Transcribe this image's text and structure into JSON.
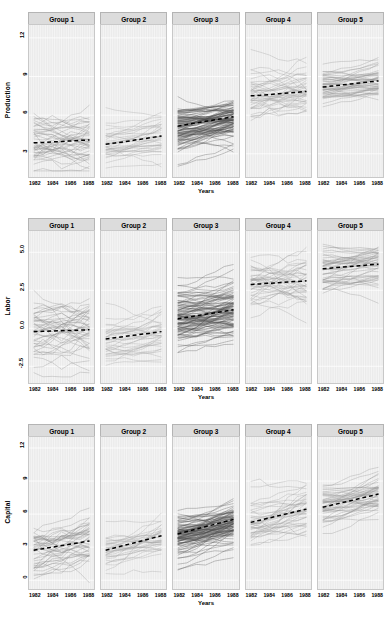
{
  "chart_data": {
    "type": "line",
    "title": "",
    "xlabel": "Years",
    "layout": "trellis 3 rows x 5 columns, spaghetti plot with dashed group-mean trend",
    "grid": true,
    "legend": "none",
    "x": [
      1982,
      1983,
      1984,
      1985,
      1986,
      1987,
      1988
    ],
    "xticks": [
      "1982",
      "1984",
      "1986",
      "1988"
    ],
    "xlim": [
      1981.5,
      1988.5
    ],
    "columns": [
      "Group 1",
      "Group 2",
      "Group 3",
      "Group 4",
      "Group 5"
    ],
    "rows": [
      {
        "ylabel": "Production",
        "ylim": [
          1.2,
          13.0
        ],
        "yticks": [
          "3",
          "6",
          "9",
          "12"
        ],
        "ytick_values": [
          3,
          6,
          9,
          12
        ],
        "panels": [
          {
            "group": "Group 1",
            "n_lines": 44,
            "band_low": 2.2,
            "band_high": 6.6,
            "trend": [
              3.85,
              3.88,
              3.92,
              3.96,
              4.0,
              4.04,
              4.08
            ],
            "spread": 0.95,
            "noise": 0.42,
            "slope_spread": 0.22,
            "line_color": "#8c8c8c",
            "seed": 11
          },
          {
            "group": "Group 2",
            "n_lines": 34,
            "band_low": 2.4,
            "band_high": 6.9,
            "trend": [
              3.74,
              3.84,
              3.94,
              4.05,
              4.16,
              4.27,
              4.38
            ],
            "spread": 0.85,
            "noise": 0.16,
            "slope_spread": 0.14,
            "line_color": "#a0a0a0",
            "seed": 23
          },
          {
            "group": "Group 3",
            "n_lines": 96,
            "band_low": 2.6,
            "band_high": 7.2,
            "trend": [
              5.15,
              5.28,
              5.4,
              5.52,
              5.64,
              5.76,
              5.88
            ],
            "spread": 0.78,
            "noise": 0.14,
            "slope_spread": 0.13,
            "line_color": "#4a4a4a",
            "seed": 37
          },
          {
            "group": "Group 4",
            "n_lines": 40,
            "band_low": 4.6,
            "band_high": 9.6,
            "trend": [
              7.5,
              7.54,
              7.6,
              7.66,
              7.72,
              7.78,
              7.84
            ],
            "spread": 0.9,
            "noise": 0.3,
            "slope_spread": 0.2,
            "line_color": "#9a9a9a",
            "seed": 53
          },
          {
            "group": "Group 5",
            "n_lines": 46,
            "band_low": 6.1,
            "band_high": 9.9,
            "trend": [
              8.18,
              8.26,
              8.34,
              8.42,
              8.5,
              8.58,
              8.66
            ],
            "spread": 0.72,
            "noise": 0.12,
            "slope_spread": 0.12,
            "line_color": "#8f8f8f",
            "seed": 71
          }
        ]
      },
      {
        "ylabel": "Labor",
        "ylim": [
          -3.6,
          6.4
        ],
        "yticks": [
          "-2.5",
          "0.0",
          "2.5",
          "5.0"
        ],
        "ytick_values": [
          -2.5,
          0,
          2.5,
          5
        ],
        "panels": [
          {
            "group": "Group 1",
            "n_lines": 44,
            "band_low": -3.0,
            "band_high": 2.6,
            "trend": [
              -0.22,
              -0.2,
              -0.18,
              -0.16,
              -0.14,
              -0.12,
              -0.1
            ],
            "spread": 1.0,
            "noise": 0.4,
            "slope_spread": 0.22,
            "line_color": "#8c8c8c",
            "seed": 101
          },
          {
            "group": "Group 2",
            "n_lines": 34,
            "band_low": -2.6,
            "band_high": 2.9,
            "trend": [
              -0.7,
              -0.62,
              -0.54,
              -0.46,
              -0.38,
              -0.3,
              -0.22
            ],
            "spread": 0.9,
            "noise": 0.18,
            "slope_spread": 0.15,
            "line_color": "#a0a0a0",
            "seed": 113
          },
          {
            "group": "Group 3",
            "n_lines": 96,
            "band_low": -2.1,
            "band_high": 3.3,
            "trend": [
              0.62,
              0.72,
              0.82,
              0.92,
              1.02,
              1.12,
              1.22
            ],
            "spread": 0.85,
            "noise": 0.14,
            "slope_spread": 0.13,
            "line_color": "#4a4a4a",
            "seed": 127
          },
          {
            "group": "Group 4",
            "n_lines": 40,
            "band_low": 0.1,
            "band_high": 5.2,
            "trend": [
              2.88,
              2.92,
              2.96,
              3.0,
              3.04,
              3.08,
              3.12
            ],
            "spread": 0.95,
            "noise": 0.3,
            "slope_spread": 0.2,
            "line_color": "#9a9a9a",
            "seed": 139
          },
          {
            "group": "Group 5",
            "n_lines": 46,
            "band_low": 2.2,
            "band_high": 5.6,
            "trend": [
              3.92,
              3.97,
              4.02,
              4.07,
              4.12,
              4.17,
              4.22
            ],
            "spread": 0.72,
            "noise": 0.12,
            "slope_spread": 0.12,
            "line_color": "#8f8f8f",
            "seed": 151
          }
        ]
      },
      {
        "ylabel": "Capital",
        "ylim": [
          -0.8,
          13.0
        ],
        "yticks": [
          "0",
          "3",
          "6",
          "9",
          "12"
        ],
        "ytick_values": [
          0,
          3,
          6,
          9,
          12
        ],
        "panels": [
          {
            "group": "Group 1",
            "n_lines": 44,
            "band_low": 0.2,
            "band_high": 6.1,
            "trend": [
              2.72,
              2.86,
              3.0,
              3.14,
              3.28,
              3.42,
              3.56
            ],
            "spread": 1.1,
            "noise": 0.4,
            "slope_spread": 0.26,
            "line_color": "#8c8c8c",
            "seed": 211
          },
          {
            "group": "Group 2",
            "n_lines": 34,
            "band_low": 0.5,
            "band_high": 6.0,
            "trend": [
              2.72,
              2.94,
              3.16,
              3.38,
              3.6,
              3.82,
              4.04
            ],
            "spread": 0.95,
            "noise": 0.2,
            "slope_spread": 0.18,
            "line_color": "#a0a0a0",
            "seed": 223
          },
          {
            "group": "Group 3",
            "n_lines": 96,
            "band_low": 1.9,
            "band_high": 7.4,
            "trend": [
              4.2,
              4.42,
              4.64,
              4.86,
              5.08,
              5.3,
              5.52
            ],
            "spread": 0.9,
            "noise": 0.15,
            "slope_spread": 0.16,
            "line_color": "#4a4a4a",
            "seed": 239
          },
          {
            "group": "Group 4",
            "n_lines": 40,
            "band_low": 2.9,
            "band_high": 8.8,
            "trend": [
              5.25,
              5.45,
              5.65,
              5.85,
              6.05,
              6.25,
              6.45
            ],
            "spread": 1.05,
            "noise": 0.3,
            "slope_spread": 0.24,
            "line_color": "#9a9a9a",
            "seed": 251
          },
          {
            "group": "Group 5",
            "n_lines": 46,
            "band_low": 4.6,
            "band_high": 10.4,
            "trend": [
              6.62,
              6.82,
              7.02,
              7.22,
              7.42,
              7.62,
              7.82
            ],
            "spread": 0.95,
            "noise": 0.16,
            "slope_spread": 0.2,
            "line_color": "#8f8f8f",
            "seed": 263
          }
        ]
      }
    ],
    "style": {
      "panel_background": "#ebebeb",
      "gridline_color": "#ffffff",
      "strip_background": "#dcdcdc",
      "strip_border": "#b4b4b4",
      "trend_line_color": "#000000",
      "trend_line_dash": "4,3"
    }
  }
}
